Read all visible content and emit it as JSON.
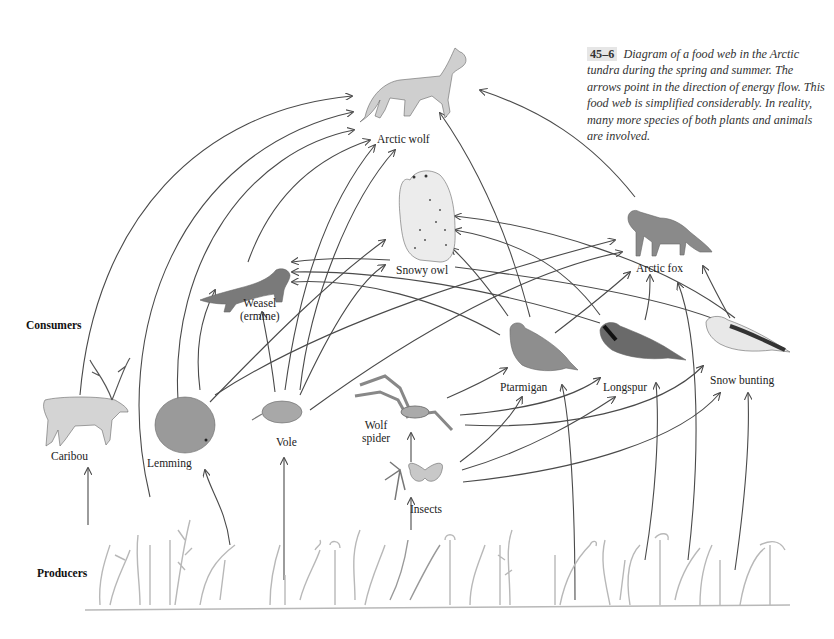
{
  "caption": {
    "figure_number": "45–6",
    "text": "Diagram of a food web in the Arctic tundra during the spring and summer. The arrows point in the direction of energy flow. This food web is simplified considerably. In reality, many more species of both plants and animals are involved."
  },
  "sections": {
    "consumers": "Consumers",
    "producers": "Producers"
  },
  "organisms": {
    "arctic_wolf": "Arctic wolf",
    "snowy_owl": "Snowy owl",
    "arctic_fox": "Arctic fox",
    "weasel": "Weasel",
    "weasel_alt": "(ermine)",
    "caribou": "Caribou",
    "lemming": "Lemming",
    "vole": "Vole",
    "wolf_spider_1": "Wolf",
    "wolf_spider_2": "spider",
    "ptarmigan": "Ptarmigan",
    "longspur": "Longspur",
    "snow_bunting": "Snow bunting",
    "insects": "Insects"
  },
  "energy_flows": [
    {
      "from": "Producers",
      "to": "Caribou"
    },
    {
      "from": "Producers",
      "to": "Lemming"
    },
    {
      "from": "Producers",
      "to": "Vole"
    },
    {
      "from": "Producers",
      "to": "Insects"
    },
    {
      "from": "Producers",
      "to": "Ptarmigan"
    },
    {
      "from": "Producers",
      "to": "Longspur"
    },
    {
      "from": "Producers",
      "to": "Snow bunting"
    },
    {
      "from": "Producers",
      "to": "Arctic fox"
    },
    {
      "from": "Producers",
      "to": "Arctic wolf"
    },
    {
      "from": "Caribou",
      "to": "Arctic wolf"
    },
    {
      "from": "Lemming",
      "to": "Arctic wolf"
    },
    {
      "from": "Lemming",
      "to": "Weasel"
    },
    {
      "from": "Lemming",
      "to": "Snowy owl"
    },
    {
      "from": "Lemming",
      "to": "Arctic fox"
    },
    {
      "from": "Vole",
      "to": "Arctic wolf"
    },
    {
      "from": "Vole",
      "to": "Weasel"
    },
    {
      "from": "Vole",
      "to": "Snowy owl"
    },
    {
      "from": "Vole",
      "to": "Arctic fox"
    },
    {
      "from": "Weasel",
      "to": "Arctic wolf"
    },
    {
      "from": "Snowy owl",
      "to": "Weasel"
    },
    {
      "from": "Ptarmigan",
      "to": "Arctic wolf"
    },
    {
      "from": "Ptarmigan",
      "to": "Snowy owl"
    },
    {
      "from": "Ptarmigan",
      "to": "Arctic fox"
    },
    {
      "from": "Ptarmigan",
      "to": "Weasel"
    },
    {
      "from": "Longspur",
      "to": "Snowy owl"
    },
    {
      "from": "Longspur",
      "to": "Arctic fox"
    },
    {
      "from": "Longspur",
      "to": "Weasel"
    },
    {
      "from": "Snow bunting",
      "to": "Snowy owl"
    },
    {
      "from": "Snow bunting",
      "to": "Arctic fox"
    },
    {
      "from": "Snow bunting",
      "to": "Weasel"
    },
    {
      "from": "Arctic fox",
      "to": "Arctic wolf"
    },
    {
      "from": "Insects",
      "to": "Wolf spider"
    },
    {
      "from": "Insects",
      "to": "Ptarmigan"
    },
    {
      "from": "Insects",
      "to": "Longspur"
    },
    {
      "from": "Insects",
      "to": "Snow bunting"
    },
    {
      "from": "Wolf spider",
      "to": "Ptarmigan"
    },
    {
      "from": "Wolf spider",
      "to": "Longspur"
    },
    {
      "from": "Wolf spider",
      "to": "Snow bunting"
    }
  ]
}
